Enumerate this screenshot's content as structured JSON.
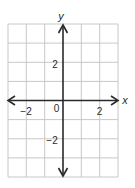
{
  "figure": {
    "type": "coordinate-plane"
  },
  "axes": {
    "x_label": "x",
    "y_label": "y",
    "origin_label": "0",
    "x_ticks": [
      {
        "value": -2,
        "label": "−2"
      },
      {
        "value": 2,
        "label": "2"
      }
    ],
    "y_ticks": [
      {
        "value": 2,
        "label": "2"
      },
      {
        "value": -2,
        "label": "−2"
      }
    ],
    "x_range": [
      -3,
      3
    ],
    "y_range": [
      -4,
      4
    ],
    "arrows": [
      "left",
      "right",
      "up",
      "down"
    ]
  },
  "grid": {
    "columns": 6,
    "rows": 8,
    "unit": 1,
    "visible": true
  },
  "colors": {
    "grid_line": "#c8c8c8",
    "axis_line": "#2a2a2a",
    "label": "#2a2a2a",
    "background": "#ffffff"
  }
}
